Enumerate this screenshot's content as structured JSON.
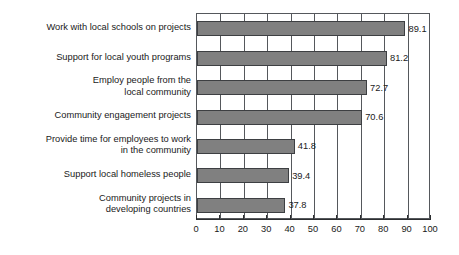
{
  "chart_data": {
    "type": "bar",
    "orientation": "horizontal",
    "title": "",
    "subtitle": "",
    "xlabel": "",
    "ylabel": "",
    "xlim": [
      0,
      100
    ],
    "xticks": [
      0,
      10,
      20,
      30,
      40,
      50,
      60,
      70,
      80,
      90,
      100
    ],
    "xtick_labels": [
      "0",
      "10",
      "20",
      "30",
      "40",
      "50",
      "60",
      "70",
      "80",
      "90",
      "100"
    ],
    "grid": "vertical",
    "legend": null,
    "bar_color": "#808080",
    "bar_edge_color": "#3d3f42",
    "axis_color": "#55585c",
    "background": "#ffffff",
    "categories": [
      "Work with local schools on projects",
      "Support for local youth programs",
      "Employ people from the\nlocal community",
      "Community engagement projects",
      "Provide time for employees to work\nin the community",
      "Support local homeless people",
      "Community projects in\ndeveloping countries"
    ],
    "values": [
      89.1,
      81.2,
      72.7,
      70.6,
      41.8,
      39.4,
      37.8
    ],
    "value_labels": [
      "89.1",
      "81.2",
      "72.7",
      "70.6",
      "41.8",
      "39.4",
      "37.8"
    ]
  }
}
